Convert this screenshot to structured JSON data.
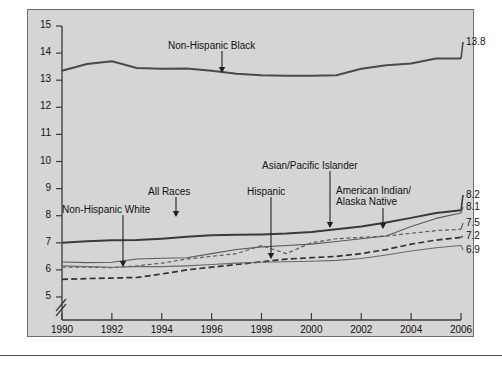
{
  "figure": {
    "background": "#d5d5d5",
    "page_background": "#ffffff",
    "border_color": "#6e6e6e"
  },
  "axis": {
    "ylabel": "Percent of Infants",
    "yticks": [
      "15",
      "14",
      "13",
      "12",
      "11",
      "10",
      "9",
      "8",
      "7",
      "6",
      "5"
    ],
    "xticks": [
      "1990",
      "1992",
      "1994",
      "1996",
      "1998",
      "2000",
      "2002",
      "2004",
      "2006"
    ],
    "axis_break": true
  },
  "annotations": [
    {
      "id": "non-hispanic-black",
      "label": "Non-Hispanic Black"
    },
    {
      "id": "all-races",
      "label": "All Races"
    },
    {
      "id": "non-hispanic-white",
      "label": "Non-Hispanic White"
    },
    {
      "id": "hispanic",
      "label": "Hispanic"
    },
    {
      "id": "asian-pacific-islander",
      "label": "Asian/Pacific Islander"
    },
    {
      "id": "american-indian-alaska-native-1",
      "label": "American Indian/"
    },
    {
      "id": "american-indian-alaska-native-2",
      "label": "Alaska Native"
    }
  ],
  "end_labels": [
    {
      "id": "end-label-black",
      "value": "13.8"
    },
    {
      "id": "end-label-aian",
      "value": "8.2"
    },
    {
      "id": "end-label-all-races",
      "value": "8.1"
    },
    {
      "id": "end-label-api",
      "value": "7.5"
    },
    {
      "id": "end-label-hispanic",
      "value": "7.2"
    },
    {
      "id": "end-label-nhwhite",
      "value": "6.9"
    }
  ],
  "chart_data": {
    "type": "line",
    "title": "",
    "xlabel": "",
    "ylabel": "Percent of Infants",
    "xlim": [
      1990,
      2006
    ],
    "ylim": [
      5,
      15
    ],
    "grid": false,
    "legend": "inline-annotations",
    "axis_break_below": 5,
    "x": [
      1990,
      1991,
      1992,
      1993,
      1994,
      1995,
      1996,
      1997,
      1998,
      1999,
      2000,
      2001,
      2002,
      2003,
      2004,
      2005,
      2006
    ],
    "series": [
      {
        "name": "Non-Hispanic Black",
        "style": "solid-thick",
        "color": "#4a4a4a",
        "end_value": 13.8,
        "values": [
          13.35,
          13.6,
          13.7,
          13.45,
          13.42,
          13.43,
          13.35,
          13.24,
          13.18,
          13.16,
          13.16,
          13.18,
          13.42,
          13.55,
          13.62,
          13.8,
          13.8
        ]
      },
      {
        "name": "American Indian/Alaska Native",
        "style": "solid-thick",
        "color": "#3a3a3a",
        "end_value": 8.2,
        "values": [
          7.0,
          7.06,
          7.09,
          7.1,
          7.15,
          7.22,
          7.28,
          7.3,
          7.31,
          7.34,
          7.4,
          7.5,
          7.6,
          7.75,
          7.92,
          8.1,
          8.2
        ]
      },
      {
        "name": "All Races",
        "style": "solid-thin",
        "color": "#5a5a5a",
        "end_value": 8.1,
        "values": [
          6.29,
          6.27,
          6.28,
          6.4,
          6.43,
          6.45,
          6.6,
          6.75,
          6.85,
          6.9,
          6.95,
          7.05,
          7.15,
          7.25,
          7.6,
          7.9,
          8.1
        ]
      },
      {
        "name": "Asian/Pacific Islander",
        "style": "dashed-fine",
        "color": "#5a5a5a",
        "end_value": 7.5,
        "values": [
          6.1,
          6.1,
          6.08,
          6.15,
          6.25,
          6.4,
          6.5,
          6.6,
          6.9,
          6.6,
          7.0,
          7.15,
          7.2,
          7.25,
          7.35,
          7.45,
          7.5
        ]
      },
      {
        "name": "Hispanic",
        "style": "dashed-coarse",
        "color": "#333333",
        "end_value": 7.2,
        "values": [
          5.65,
          5.68,
          5.7,
          5.72,
          5.85,
          6.0,
          6.1,
          6.2,
          6.3,
          6.4,
          6.45,
          6.5,
          6.6,
          6.75,
          6.95,
          7.1,
          7.2
        ]
      },
      {
        "name": "Non-Hispanic White",
        "style": "solid-thin",
        "color": "#6a6a6a",
        "end_value": 6.9,
        "values": [
          6.15,
          6.12,
          6.1,
          6.12,
          6.12,
          6.15,
          6.2,
          6.25,
          6.28,
          6.3,
          6.32,
          6.35,
          6.42,
          6.55,
          6.7,
          6.82,
          6.9
        ]
      }
    ]
  }
}
